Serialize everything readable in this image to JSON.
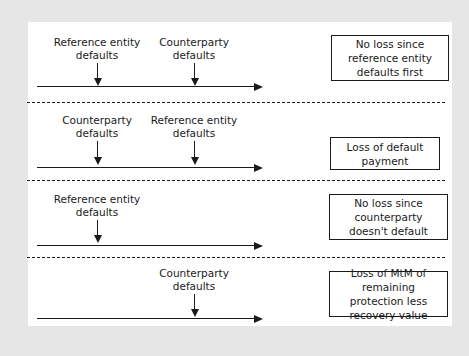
{
  "scenarios": [
    {
      "events": [
        {
          "label_line1": "Reference entity",
          "label_line2": "defaults"
        },
        {
          "label_line1": "Counterparty",
          "label_line2": "defaults"
        }
      ],
      "outcome": "No loss since reference entity defaults first"
    },
    {
      "events": [
        {
          "label_line1": "Counterparty",
          "label_line2": "defaults"
        },
        {
          "label_line1": "Reference entity",
          "label_line2": "defaults"
        }
      ],
      "outcome": "Loss of default payment"
    },
    {
      "events": [
        {
          "label_line1": "Reference entity",
          "label_line2": "defaults"
        }
      ],
      "outcome": "No loss since counterparty doesn't default"
    },
    {
      "events": [
        {
          "label_line1": "Counterparty",
          "label_line2": "defaults"
        }
      ],
      "outcome": "Loss of MtM of remaining protection less recovery value"
    }
  ]
}
